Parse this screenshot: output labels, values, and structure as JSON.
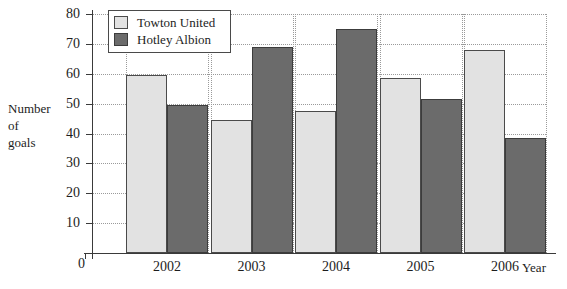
{
  "chart_data": {
    "type": "bar",
    "title": "",
    "xlabel": "Year",
    "ylabel": "Number of goals",
    "ylabel_lines": [
      "Number",
      "of",
      "goals"
    ],
    "categories": [
      "2002",
      "2003",
      "2004",
      "2005",
      "2006"
    ],
    "series": [
      {
        "name": "Towton United",
        "color": "#e2e2e2",
        "values": [
          59.5,
          44.5,
          47.5,
          58.5,
          68
        ]
      },
      {
        "name": "Hotley Albion",
        "color": "#6b6b6b",
        "values": [
          49.5,
          69,
          75,
          51.5,
          38.5
        ]
      }
    ],
    "ylim": [
      0,
      80
    ],
    "ytick_labels": [
      "0",
      "10",
      "20",
      "30",
      "40",
      "50",
      "60",
      "70",
      "80"
    ],
    "ytick_values": [
      0,
      10,
      20,
      30,
      40,
      50,
      60,
      70,
      80
    ],
    "grid": true,
    "grid_style": "dotted",
    "legend_position": "top-left",
    "zero_label": "0"
  }
}
